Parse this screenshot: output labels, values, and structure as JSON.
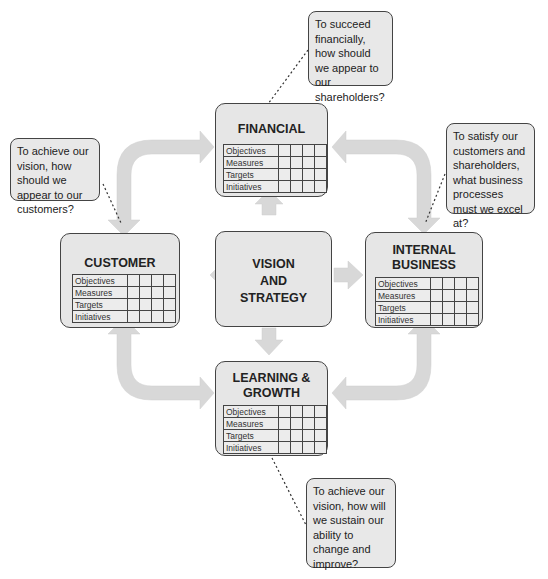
{
  "colors": {
    "box_fill": "#e6e6e6",
    "arrow_fill": "#d6d6d6",
    "border": "#444444"
  },
  "center": {
    "lines": [
      "VISION",
      "AND",
      "STRATEGY"
    ]
  },
  "row_labels": [
    "Objectives",
    "Measures",
    "Targets",
    "Initiatives"
  ],
  "perspectives": {
    "financial": {
      "title_lines": [
        "FINANCIAL"
      ]
    },
    "customer": {
      "title_lines": [
        "CUSTOMER"
      ]
    },
    "internal": {
      "title_lines": [
        "INTERNAL",
        "BUSINESS"
      ]
    },
    "learning": {
      "title_lines": [
        "LEARNING &",
        "GROWTH"
      ]
    }
  },
  "questions": {
    "financial": "To succeed financially, how should we appear to our shareholders?",
    "customer": "To achieve our vision, how should we appear to our customers?",
    "internal": "To satisfy our customers and shareholders, what business processes must we excel at?",
    "learning": "To achieve our vision, how will we sustain our ability to change and improve?"
  }
}
